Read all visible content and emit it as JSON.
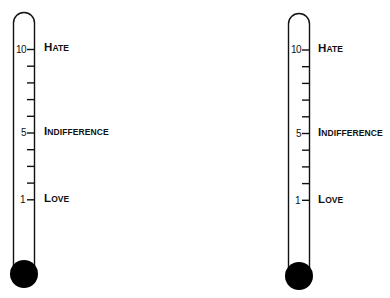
{
  "diagram": {
    "type": "thermometer-scale",
    "thermometers": [
      {
        "id": "left",
        "scale": {
          "min": 1,
          "max": 10,
          "ticks": [
            10,
            9,
            8,
            7,
            6,
            5,
            4,
            3,
            2,
            1
          ]
        },
        "numbers": {
          "n10": "10",
          "n5": "5",
          "n1": "1"
        },
        "labels": {
          "hate": {
            "first": "H",
            "rest": "ate",
            "value": 10
          },
          "indifference": {
            "first": "I",
            "rest": "ndifference",
            "value": 5
          },
          "love": {
            "first": "L",
            "rest": "ove",
            "value": 1
          }
        },
        "bulb_color": "#000000"
      },
      {
        "id": "right",
        "scale": {
          "min": 1,
          "max": 10,
          "ticks": [
            10,
            9,
            8,
            7,
            6,
            5,
            4,
            3,
            2,
            1
          ]
        },
        "numbers": {
          "n10": "10",
          "n5": "5",
          "n1": "1"
        },
        "labels": {
          "hate": {
            "first": "H",
            "rest": "ate",
            "value": 10
          },
          "indifference": {
            "first": "I",
            "rest": "ndifference",
            "value": 5
          },
          "love": {
            "first": "L",
            "rest": "ove",
            "value": 1
          }
        },
        "bulb_color": "#000000"
      }
    ]
  }
}
